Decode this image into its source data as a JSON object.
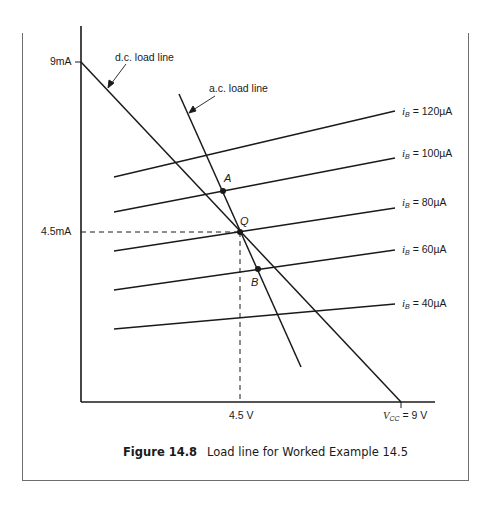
{
  "figure": {
    "number": "Figure 14.8",
    "caption": "Load line for Worked Example 14.5"
  },
  "axes": {
    "y_ticks": [
      {
        "label": "9mA",
        "value_mA": 9
      },
      {
        "label": "4.5mA",
        "value_mA": 4.5
      }
    ],
    "x_ticks": [
      {
        "label": "4.5 V",
        "value_V": 4.5
      },
      {
        "label_prefix": "V",
        "label_sub": "CC",
        "label_suffix": " = 9 V",
        "value_V": 9
      }
    ]
  },
  "annotations": {
    "dc_load_line": "d.c. load line",
    "ac_load_line": "a.c. load line",
    "point_q": "Q",
    "point_a": "A",
    "point_b": "B"
  },
  "curves": [
    {
      "var": "i",
      "sub": "B",
      "text": " = 120µA"
    },
    {
      "var": "i",
      "sub": "B",
      "text": " = 100µA"
    },
    {
      "var": "i",
      "sub": "B",
      "text": " = 80µA"
    },
    {
      "var": "i",
      "sub": "B",
      "text": " = 60µA"
    },
    {
      "var": "i",
      "sub": "B",
      "text": " = 40µA"
    }
  ],
  "colors": {
    "line": "#1a1a1a",
    "frame": "#6e6e6e",
    "background": "#ffffff"
  }
}
